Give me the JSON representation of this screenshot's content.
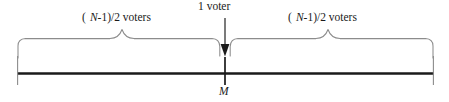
{
  "figure": {
    "type": "median-voter-number-line",
    "width": 449,
    "height": 102,
    "background_color": "#ffffff",
    "axis_color": "#1a1a1a",
    "brace_color": "#8c8c8c",
    "arrow_color": "#1a1a1a",
    "text_color": "#1a1a1a"
  },
  "labels": {
    "left_brace": "( N-1)/2 voters",
    "left_brace_prefix": "( ",
    "left_brace_var": "N",
    "left_brace_suffix": "-1)/2 voters",
    "right_brace": "( N-1)/2 voters",
    "right_brace_prefix": "( ",
    "right_brace_var": "N",
    "right_brace_suffix": "-1)/2 voters",
    "center_arrow": "1 voter",
    "axis_point": "M"
  },
  "geometry": {
    "axis_y": 73,
    "axis_x_start": 17,
    "axis_x_end": 434,
    "center_x": 225,
    "left_brace_peak_x": 122,
    "right_brace_peak_x": 328,
    "brace_top_y": 38,
    "arrow_top_y": 18,
    "arrow_tip_y": 56
  }
}
